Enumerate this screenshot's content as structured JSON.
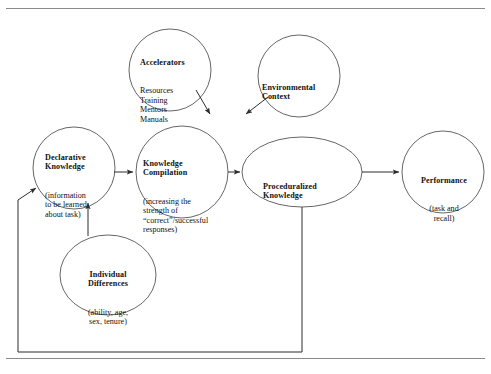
{
  "figure": {
    "type": "process-flow-diagram",
    "stroke_color": "#4a4a4a",
    "text_color": "#111111",
    "rule_color": "#8a8a8a",
    "background": "#ffffff"
  },
  "rules": {
    "top_rule": "horizontal-rule",
    "bottom_rule": "horizontal-rule"
  },
  "nodes": {
    "accelerators": {
      "title": "Accelerators",
      "lines": "Resources\nTraining\nMentors\nManuals",
      "shape": "circle"
    },
    "environmental_context": {
      "title": "Environmental\nContext",
      "lines": "",
      "shape": "circle"
    },
    "declarative_knowledge": {
      "title": "Declarative\nKnowledge",
      "lines": "(information\nto be learned\nabout task)",
      "shape": "circle"
    },
    "knowledge_compilation": {
      "title": "Knowledge\nCompilation",
      "lines": "(increasing the\nstrength of\n“correct”/successful\nresponses)",
      "shape": "circle"
    },
    "proceduralized_knowledge": {
      "title": "Proceduralized\nKnowledge",
      "lines": "",
      "shape": "ellipse"
    },
    "performance": {
      "title": "Performance",
      "lines": "(task and\nrecall)",
      "shape": "circle"
    },
    "individual_differences": {
      "title": "Individual\nDifferences",
      "lines": "(ability, age,\nsex, tenure)",
      "shape": "ellipse"
    }
  },
  "edges": [
    {
      "name": "accelerators-to-knowledge-compilation",
      "from": "accelerators",
      "to": "knowledge_compilation",
      "style": "arrow"
    },
    {
      "name": "environmental-context-to-knowledge-compilation",
      "from": "environmental_context",
      "to": "knowledge_compilation",
      "style": "arrow"
    },
    {
      "name": "declarative-to-knowledge-compilation",
      "from": "declarative_knowledge",
      "to": "knowledge_compilation",
      "style": "arrow"
    },
    {
      "name": "knowledge-compilation-to-proceduralized",
      "from": "knowledge_compilation",
      "to": "proceduralized_knowledge",
      "style": "arrow"
    },
    {
      "name": "proceduralized-to-performance",
      "from": "proceduralized_knowledge",
      "to": "performance",
      "style": "arrow"
    },
    {
      "name": "individual-differences-to-declarative",
      "from": "individual_differences",
      "to": "declarative_knowledge",
      "style": "arrow"
    },
    {
      "name": "proceduralized-feedback-to-declarative",
      "from": "proceduralized_knowledge",
      "to": "declarative_knowledge",
      "style": "arrow-elbow-feedback"
    }
  ]
}
